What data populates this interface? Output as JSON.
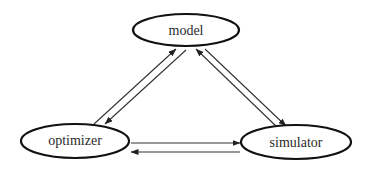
{
  "diagram": {
    "type": "cycle-triangle",
    "nodes": [
      {
        "id": "model",
        "label": "model",
        "cx": 186,
        "cy": 30,
        "rx": 53,
        "ry": 16
      },
      {
        "id": "optimizer",
        "label": "optimizer",
        "cx": 75,
        "cy": 141,
        "rx": 54,
        "ry": 17
      },
      {
        "id": "simulator",
        "label": "simulator",
        "cx": 296,
        "cy": 142,
        "rx": 55,
        "ry": 17
      }
    ],
    "edges": [
      {
        "from": "optimizer",
        "to": "model",
        "x1": 94,
        "y1": 124,
        "x2": 176,
        "y2": 49
      },
      {
        "from": "model",
        "to": "optimizer",
        "x1": 186,
        "y1": 50,
        "x2": 105,
        "y2": 124
      },
      {
        "from": "simulator",
        "to": "model",
        "x1": 277,
        "y1": 127,
        "x2": 196,
        "y2": 49
      },
      {
        "from": "model",
        "to": "simulator",
        "x1": 205,
        "y1": 49,
        "x2": 286,
        "y2": 126
      },
      {
        "from": "optimizer",
        "to": "simulator",
        "x1": 131,
        "y1": 143,
        "x2": 240,
        "y2": 143
      },
      {
        "from": "simulator",
        "to": "optimizer",
        "x1": 240,
        "y1": 152,
        "x2": 131,
        "y2": 152
      }
    ]
  },
  "labels": {
    "model": "model",
    "optimizer": "optimizer",
    "simulator": "simulator"
  }
}
